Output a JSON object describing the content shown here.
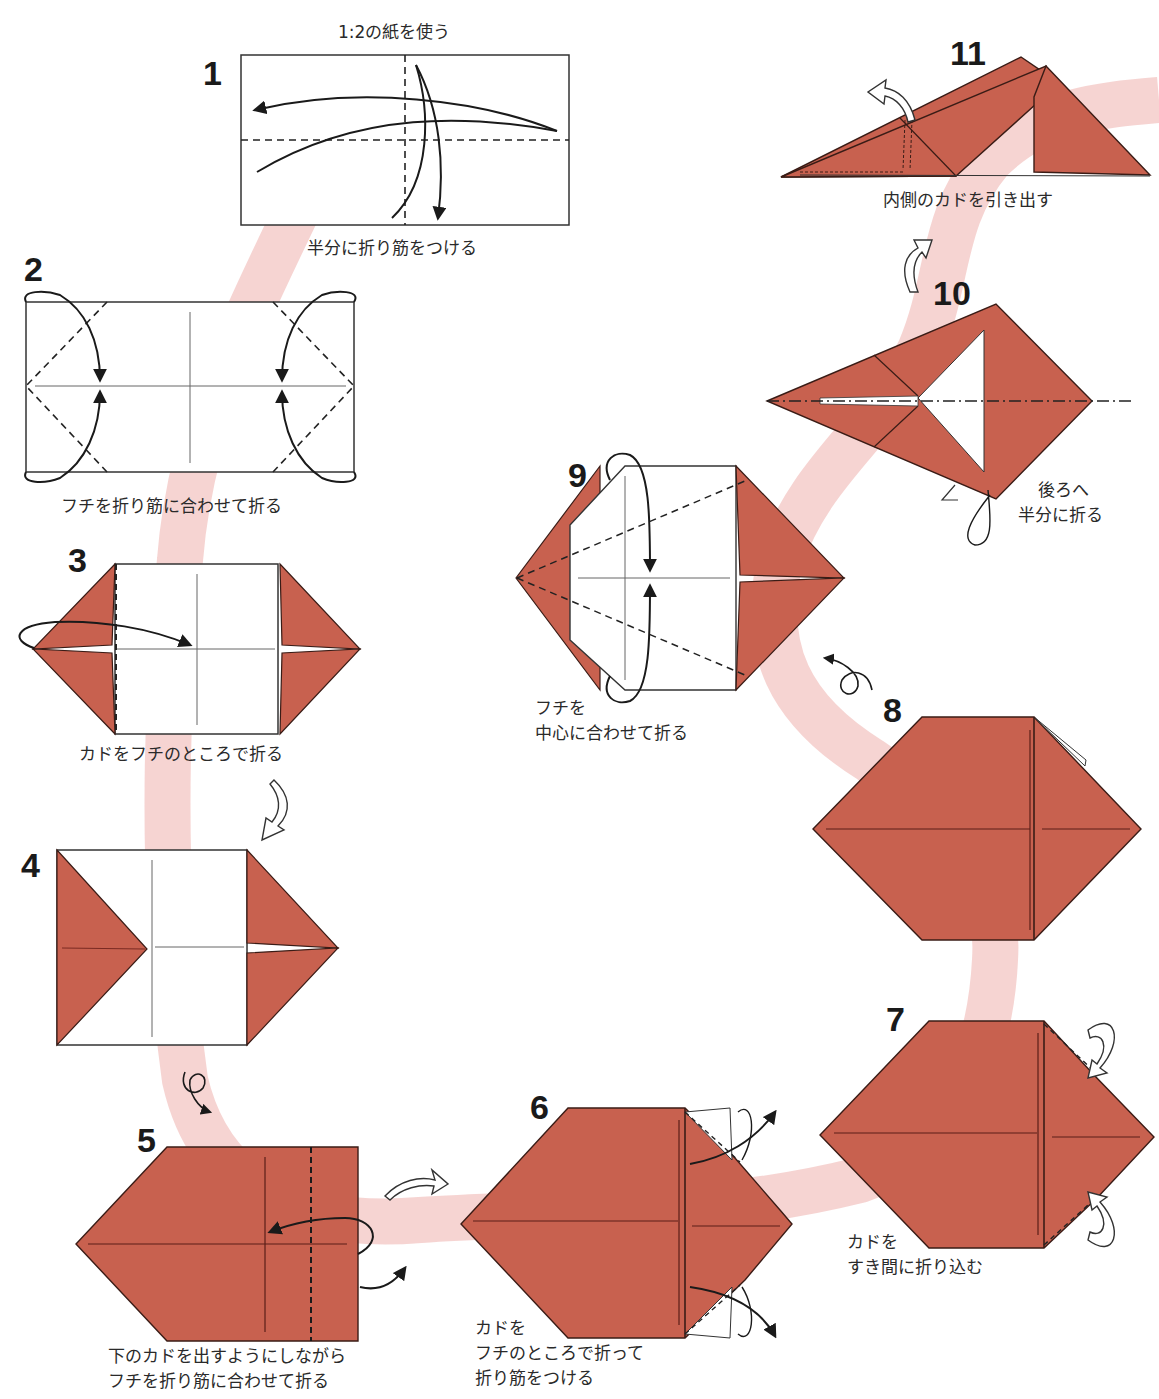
{
  "colors": {
    "paper": "#C8614F",
    "paper_edge": "#3a1c16",
    "crease": "#7A2A22",
    "path_band": "#F6D2D0",
    "line": "#1a1a1a"
  },
  "steps": [
    {
      "number": "1",
      "note": "1:2の紙を使う",
      "instruction": "半分に折り筋をつける"
    },
    {
      "number": "2",
      "instruction": "フチを折り筋に合わせて折る"
    },
    {
      "number": "3",
      "instruction": "カドをフチのところで折る"
    },
    {
      "number": "4",
      "instruction": ""
    },
    {
      "number": "5",
      "instruction_line1": "下のカドを出すようにしながら",
      "instruction_line2": "フチを折り筋に合わせて折る"
    },
    {
      "number": "6",
      "instruction_line1": "カドを",
      "instruction_line2": "フチのところで折って",
      "instruction_line3": "折り筋をつける"
    },
    {
      "number": "7",
      "instruction_line1": "カドを",
      "instruction_line2": "すき間に折り込む"
    },
    {
      "number": "8",
      "instruction": ""
    },
    {
      "number": "9",
      "instruction_line1": "フチを",
      "instruction_line2": "中心に合わせて折る"
    },
    {
      "number": "10",
      "instruction_line1": "後ろへ",
      "instruction_line2": "半分に折る"
    },
    {
      "number": "11",
      "instruction": "内側のカドを引き出す"
    }
  ],
  "symbols": [
    {
      "type": "turn-over-icon",
      "between": "4-5"
    },
    {
      "type": "turn-over-icon",
      "between": "8-9"
    },
    {
      "type": "rotate-hollow-arrow-icon",
      "between": "3-4"
    },
    {
      "type": "rotate-hollow-arrow-icon",
      "between": "5-6"
    },
    {
      "type": "rotate-hollow-arrow-icon",
      "between": "10-11"
    }
  ]
}
